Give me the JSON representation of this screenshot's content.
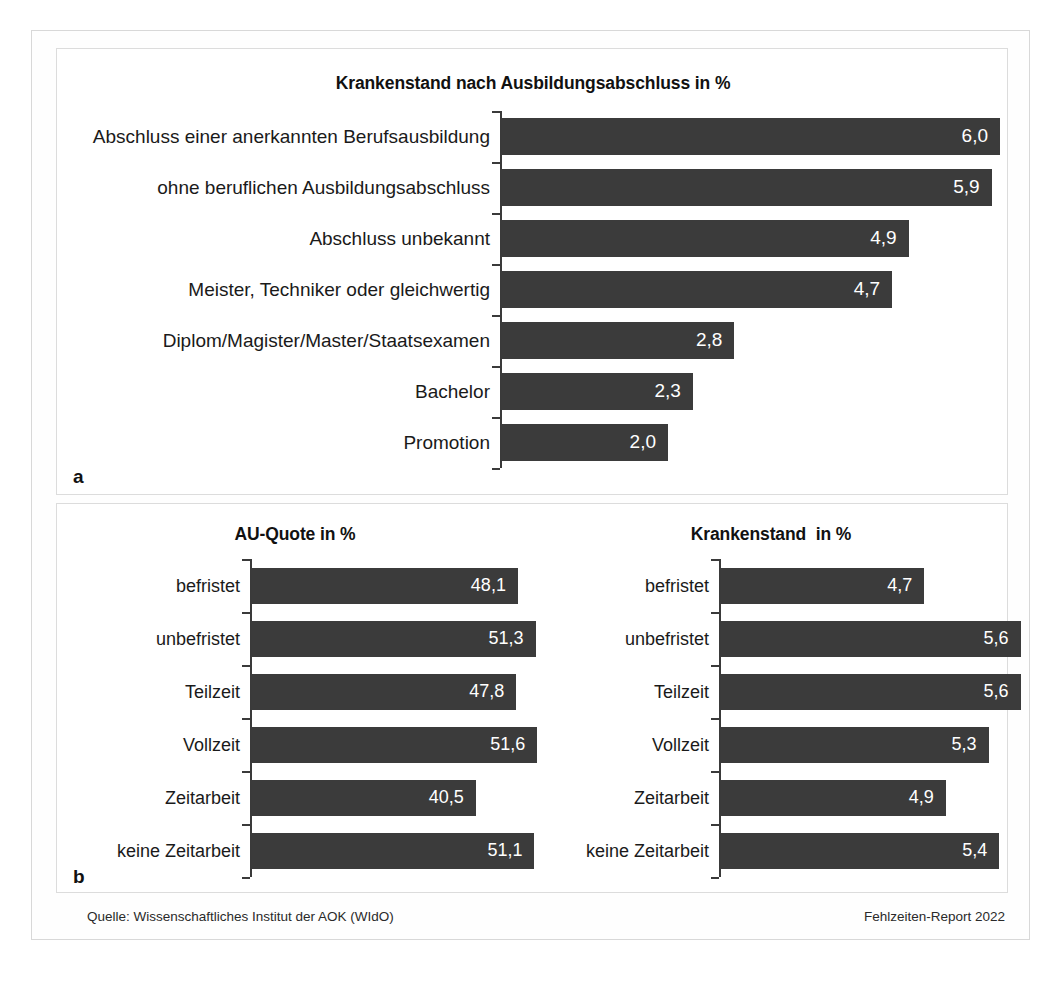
{
  "figure": {
    "panel_a_letter": "a",
    "panel_b_letter": "b",
    "footer_source": "Quelle: Wissenschaftliches Institut der AOK (WIdO)",
    "footer_report": "Fehlzeiten-Report 2022",
    "bar_color": "#3b3b3b",
    "axis_color": "#3a3a3a",
    "value_label_color": "#ffffff"
  },
  "chart_data": [
    {
      "id": "krankenstand-ausbildungsabschluss",
      "type": "bar",
      "orientation": "horizontal",
      "title": "Krankenstand nach Ausbildungsabschluss in %",
      "xlabel": "",
      "ylabel": "",
      "xlim": [
        0,
        6.0
      ],
      "grid": false,
      "legend": false,
      "categories": [
        "Abschluss einer anerkannten Berufsausbildung",
        "ohne beruflichen Ausbildungsabschluss",
        "Abschluss unbekannt",
        "Meister, Techniker oder gleichwertig",
        "Diplom/Magister/Master/Staatsexamen",
        "Bachelor",
        "Promotion"
      ],
      "values": [
        6.0,
        5.9,
        4.9,
        4.7,
        2.8,
        2.3,
        2.0
      ],
      "value_labels": [
        "6,0",
        "5,9",
        "4,9",
        "4,7",
        "2,8",
        "2,3",
        "2,0"
      ]
    },
    {
      "id": "au-quote",
      "type": "bar",
      "orientation": "horizontal",
      "title": "AU-Quote in %",
      "xlabel": "",
      "ylabel": "",
      "xlim": [
        0,
        55
      ],
      "grid": false,
      "legend": false,
      "categories": [
        "befristet",
        "unbefristet",
        "Teilzeit",
        "Vollzeit",
        "Zeitarbeit",
        "keine Zeitarbeit"
      ],
      "values": [
        48.1,
        51.3,
        47.8,
        51.6,
        40.5,
        51.1
      ],
      "value_labels": [
        "48,1",
        "51,3",
        "47,8",
        "51,6",
        "40,5",
        "51,1"
      ]
    },
    {
      "id": "krankenstand-vertragsart",
      "type": "bar",
      "orientation": "horizontal",
      "title": "Krankenstand  in %",
      "xlabel": "",
      "ylabel": "",
      "xlim": [
        0,
        6.0
      ],
      "grid": false,
      "legend": false,
      "categories": [
        "befristet",
        "unbefristet",
        "Teilzeit",
        "Vollzeit",
        "Zeitarbeit",
        "keine Zeitarbeit"
      ],
      "values": [
        4.7,
        5.6,
        5.6,
        5.3,
        4.9,
        5.4
      ],
      "value_labels": [
        "4,7",
        "5,6",
        "5,6",
        "5,3",
        "4,9",
        "5,4"
      ]
    }
  ]
}
